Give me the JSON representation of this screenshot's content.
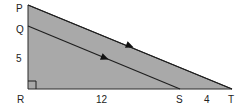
{
  "diagram": {
    "type": "geometry-right-triangle",
    "colors": {
      "fill": "#a9a9a9",
      "stroke": "#2a2a2a",
      "background": "#ffffff"
    },
    "vertices": {
      "P": {
        "label": "P",
        "x": 28,
        "y": 5
      },
      "Q": {
        "label": "Q",
        "x": 28,
        "y": 26
      },
      "R": {
        "label": "R",
        "x": 28,
        "y": 89
      },
      "S": {
        "label": "S",
        "x": 180,
        "y": 89
      },
      "T": {
        "label": "T",
        "x": 232,
        "y": 89
      }
    },
    "segments": [
      {
        "from": "P",
        "to": "T",
        "arrow": true
      },
      {
        "from": "Q",
        "to": "S",
        "arrow": true
      },
      {
        "from": "P",
        "to": "R",
        "arrow": false
      },
      {
        "from": "R",
        "to": "T",
        "arrow": false
      }
    ],
    "right_angle_at": "R",
    "measures": {
      "QR": "5",
      "RS": "12",
      "ST": "4"
    },
    "parallel": [
      "PT",
      "QS"
    ]
  }
}
